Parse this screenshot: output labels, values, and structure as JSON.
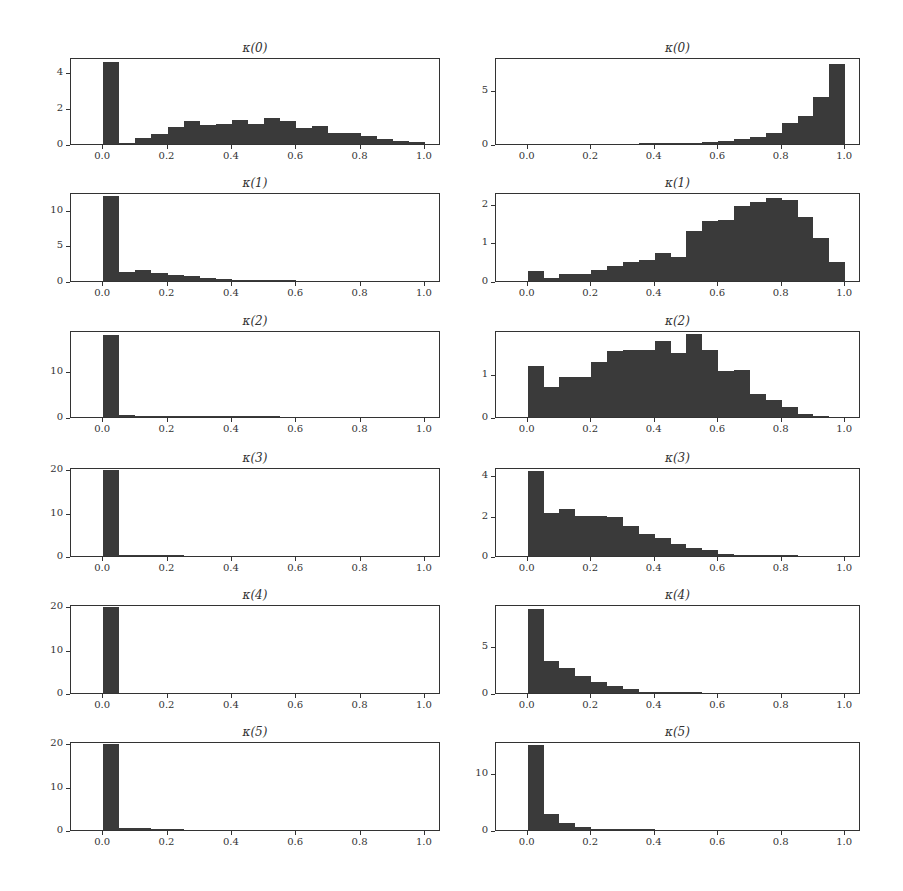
{
  "chart_data": [
    {
      "type": "bar",
      "panel": "left-0",
      "title": "κ(0)",
      "bin_edges_start": 0.0,
      "bin_width": 0.05,
      "values": [
        4.5,
        0.05,
        0.35,
        0.55,
        0.95,
        1.25,
        1.05,
        1.1,
        1.35,
        1.1,
        1.45,
        1.25,
        0.9,
        1.0,
        0.6,
        0.6,
        0.45,
        0.25,
        0.15,
        0.1
      ],
      "ylim": [
        0,
        4.8
      ],
      "yticks": [
        "0",
        "2",
        "4"
      ],
      "ytick_values": [
        0,
        2,
        4
      ],
      "xlim": [
        -0.1,
        1.05
      ],
      "xticks": [
        "0.0",
        "0.2",
        "0.4",
        "0.6",
        "0.8",
        "1.0"
      ]
    },
    {
      "type": "bar",
      "panel": "right-0",
      "title": "κ(0)",
      "bin_edges_start": 0.0,
      "bin_width": 0.05,
      "values": [
        0,
        0,
        0,
        0,
        0,
        0,
        0,
        0.02,
        0.03,
        0.05,
        0.1,
        0.2,
        0.25,
        0.45,
        0.6,
        1.0,
        1.9,
        2.55,
        4.3,
        7.4
      ],
      "ylim": [
        0,
        8
      ],
      "yticks": [
        "0",
        "5"
      ],
      "ytick_values": [
        0,
        5
      ],
      "xlim": [
        -0.1,
        1.05
      ],
      "xticks": [
        "0.0",
        "0.2",
        "0.4",
        "0.6",
        "0.8",
        "1.0"
      ]
    },
    {
      "type": "bar",
      "panel": "left-1",
      "title": "κ(1)",
      "bin_edges_start": 0.0,
      "bin_width": 0.05,
      "values": [
        12.0,
        1.3,
        1.5,
        1.1,
        0.85,
        0.75,
        0.45,
        0.3,
        0.15,
        0.08,
        0.03,
        0.01,
        0,
        0,
        0,
        0,
        0,
        0,
        0,
        0
      ],
      "ylim": [
        0,
        12.5
      ],
      "yticks": [
        "0",
        "5",
        "10"
      ],
      "ytick_values": [
        0,
        5,
        10
      ],
      "xlim": [
        -0.1,
        1.05
      ],
      "xticks": [
        "0.0",
        "0.2",
        "0.4",
        "0.6",
        "0.8",
        "1.0"
      ]
    },
    {
      "type": "bar",
      "panel": "right-1",
      "title": "κ(1)",
      "bin_edges_start": 0.0,
      "bin_width": 0.05,
      "values": [
        0.25,
        0.08,
        0.17,
        0.17,
        0.28,
        0.38,
        0.48,
        0.55,
        0.72,
        0.62,
        1.3,
        1.55,
        1.57,
        1.95,
        2.05,
        2.15,
        2.1,
        1.65,
        1.1,
        0.5
      ],
      "ylim": [
        0,
        2.3
      ],
      "yticks": [
        "0",
        "1",
        "2"
      ],
      "ytick_values": [
        0,
        1,
        2
      ],
      "xlim": [
        -0.1,
        1.05
      ],
      "xticks": [
        "0.0",
        "0.2",
        "0.4",
        "0.6",
        "0.8",
        "1.0"
      ]
    },
    {
      "type": "bar",
      "panel": "left-2",
      "title": "κ(2)",
      "bin_edges_start": 0.0,
      "bin_width": 0.05,
      "values": [
        18.0,
        0.4,
        0.3,
        0.1,
        0.05,
        0.05,
        0.03,
        0.02,
        0.02,
        0.01,
        0.01,
        0,
        0,
        0,
        0,
        0,
        0,
        0,
        0,
        0
      ],
      "ylim": [
        0,
        19
      ],
      "yticks": [
        "0",
        "10"
      ],
      "ytick_values": [
        0,
        10
      ],
      "xlim": [
        -0.1,
        1.05
      ],
      "xticks": [
        "0.0",
        "0.2",
        "0.4",
        "0.6",
        "0.8",
        "1.0"
      ]
    },
    {
      "type": "bar",
      "panel": "right-2",
      "title": "κ(2)",
      "bin_edges_start": 0.0,
      "bin_width": 0.05,
      "values": [
        1.18,
        0.7,
        0.92,
        0.93,
        1.27,
        1.52,
        1.55,
        1.53,
        1.75,
        1.48,
        1.9,
        1.55,
        1.05,
        1.08,
        0.52,
        0.38,
        0.22,
        0.07,
        0.01,
        0
      ],
      "ylim": [
        0,
        2.0
      ],
      "yticks": [
        "0",
        "1"
      ],
      "ytick_values": [
        0,
        1
      ],
      "xlim": [
        -0.1,
        1.05
      ],
      "xticks": [
        "0.0",
        "0.2",
        "0.4",
        "0.6",
        "0.8",
        "1.0"
      ]
    },
    {
      "type": "bar",
      "panel": "left-3",
      "title": "κ(3)",
      "bin_edges_start": 0.0,
      "bin_width": 0.05,
      "values": [
        19.8,
        0.2,
        0.1,
        0.03,
        0.01,
        0,
        0,
        0,
        0,
        0,
        0,
        0,
        0,
        0,
        0,
        0,
        0,
        0,
        0,
        0
      ],
      "ylim": [
        0,
        20.5
      ],
      "yticks": [
        "0",
        "10",
        "20"
      ],
      "ytick_values": [
        0,
        10,
        20
      ],
      "xlim": [
        -0.1,
        1.05
      ],
      "xticks": [
        "0.0",
        "0.2",
        "0.4",
        "0.6",
        "0.8",
        "1.0"
      ]
    },
    {
      "type": "bar",
      "panel": "right-3",
      "title": "κ(3)",
      "bin_edges_start": 0.0,
      "bin_width": 0.05,
      "values": [
        4.2,
        2.15,
        2.3,
        2.0,
        2.0,
        1.95,
        1.5,
        1.1,
        0.9,
        0.6,
        0.42,
        0.3,
        0.1,
        0.05,
        0.03,
        0.02,
        0.01,
        0,
        0,
        0
      ],
      "ylim": [
        0,
        4.4
      ],
      "yticks": [
        "0",
        "2",
        "4"
      ],
      "ytick_values": [
        0,
        2,
        4
      ],
      "xlim": [
        -0.1,
        1.05
      ],
      "xticks": [
        "0.0",
        "0.2",
        "0.4",
        "0.6",
        "0.8",
        "1.0"
      ]
    },
    {
      "type": "bar",
      "panel": "left-4",
      "title": "κ(4)",
      "bin_edges_start": 0.0,
      "bin_width": 0.05,
      "values": [
        19.8,
        0,
        0,
        0,
        0,
        0,
        0,
        0,
        0,
        0,
        0,
        0,
        0,
        0,
        0,
        0,
        0,
        0,
        0,
        0
      ],
      "ylim": [
        0,
        20.5
      ],
      "yticks": [
        "0",
        "10",
        "20"
      ],
      "ytick_values": [
        0,
        10,
        20
      ],
      "xlim": [
        -0.1,
        1.05
      ],
      "xticks": [
        "0.0",
        "0.2",
        "0.4",
        "0.6",
        "0.8",
        "1.0"
      ]
    },
    {
      "type": "bar",
      "panel": "right-4",
      "title": "κ(4)",
      "bin_edges_start": 0.0,
      "bin_width": 0.05,
      "values": [
        9.0,
        3.4,
        2.7,
        1.8,
        1.2,
        0.8,
        0.45,
        0.15,
        0.08,
        0.05,
        0.03,
        0,
        0,
        0,
        0,
        0,
        0,
        0,
        0,
        0
      ],
      "ylim": [
        0,
        9.5
      ],
      "yticks": [
        "0",
        "5"
      ],
      "ytick_values": [
        0,
        5
      ],
      "xlim": [
        -0.1,
        1.05
      ],
      "xticks": [
        "0.0",
        "0.2",
        "0.4",
        "0.6",
        "0.8",
        "1.0"
      ]
    },
    {
      "type": "bar",
      "panel": "left-5",
      "title": "κ(5)",
      "bin_edges_start": 0.0,
      "bin_width": 0.05,
      "values": [
        19.8,
        0.5,
        0.4,
        0.1,
        0.05,
        0,
        0,
        0,
        0,
        0,
        0,
        0,
        0,
        0,
        0,
        0,
        0,
        0,
        0,
        0
      ],
      "ylim": [
        0,
        20.5
      ],
      "yticks": [
        "0",
        "10",
        "20"
      ],
      "ytick_values": [
        0,
        10,
        20
      ],
      "xlim": [
        -0.1,
        1.05
      ],
      "xticks": [
        "0.0",
        "0.2",
        "0.4",
        "0.6",
        "0.8",
        "1.0"
      ]
    },
    {
      "type": "bar",
      "panel": "right-5",
      "title": "κ(5)",
      "bin_edges_start": 0.0,
      "bin_width": 0.05,
      "values": [
        14.8,
        2.8,
        1.3,
        0.55,
        0.25,
        0.1,
        0.03,
        0.01,
        0,
        0,
        0,
        0,
        0,
        0,
        0,
        0,
        0,
        0,
        0,
        0
      ],
      "ylim": [
        0,
        15.5
      ],
      "yticks": [
        "0",
        "10"
      ],
      "ytick_values": [
        0,
        10
      ],
      "xlim": [
        -0.1,
        1.05
      ],
      "xticks": [
        "0.0",
        "0.2",
        "0.4",
        "0.6",
        "0.8",
        "1.0"
      ]
    }
  ],
  "layout": {
    "columns": [
      {
        "axes_left": 70,
        "axes_right": 440
      },
      {
        "axes_left": 495,
        "axes_right": 860
      }
    ],
    "rows": [
      {
        "axes_top": 58,
        "axes_bottom": 145
      },
      {
        "axes_top": 193,
        "axes_bottom": 282
      },
      {
        "axes_top": 331,
        "axes_bottom": 418
      },
      {
        "axes_top": 468,
        "axes_bottom": 557
      },
      {
        "axes_top": 605,
        "axes_bottom": 694
      },
      {
        "axes_top": 742,
        "axes_bottom": 831
      }
    ],
    "bar_color": "#3a3a3a"
  }
}
